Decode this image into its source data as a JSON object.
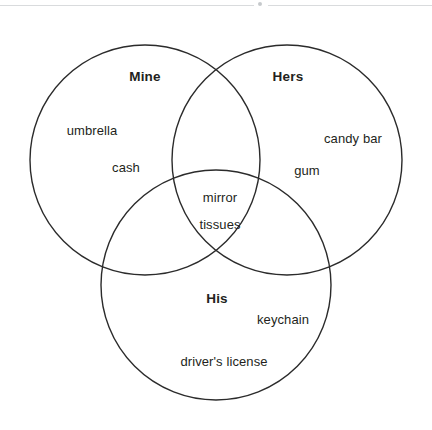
{
  "page": {
    "width": 432,
    "height": 430,
    "background": "#ffffff",
    "stroke_color": "#2b2b2b",
    "text_color": "#231f20",
    "rule_color": "#d9dbdd"
  },
  "diagram": {
    "type": "venn-3-set",
    "title": "",
    "sets": [
      {
        "id": "mine",
        "label": "Mine",
        "label_x": 145,
        "label_y": 70,
        "cx": 145,
        "cy": 160,
        "r": 115,
        "exclusive_items": [
          {
            "text": "umbrella",
            "x": 92,
            "y": 124
          },
          {
            "text": "cash",
            "x": 126,
            "y": 161
          }
        ]
      },
      {
        "id": "hers",
        "label": "Hers",
        "label_x": 288,
        "label_y": 70,
        "cx": 287,
        "cy": 160,
        "r": 115,
        "exclusive_items": [
          {
            "text": "candy bar",
            "x": 353,
            "y": 132
          },
          {
            "text": "gum",
            "x": 307,
            "y": 164
          }
        ]
      },
      {
        "id": "his",
        "label": "His",
        "label_x": 217,
        "label_y": 292,
        "cx": 216,
        "cy": 285,
        "r": 115,
        "exclusive_items": [
          {
            "text": "keychain",
            "x": 283,
            "y": 313
          },
          {
            "text": "driver's license",
            "x": 224,
            "y": 355
          }
        ]
      }
    ],
    "intersections": [
      {
        "id": "all-three",
        "sets": [
          "mine",
          "hers",
          "his"
        ],
        "items": [
          {
            "text": "mirror",
            "x": 220,
            "y": 191
          },
          {
            "text": "tissues",
            "x": 220,
            "y": 218
          }
        ]
      }
    ]
  }
}
